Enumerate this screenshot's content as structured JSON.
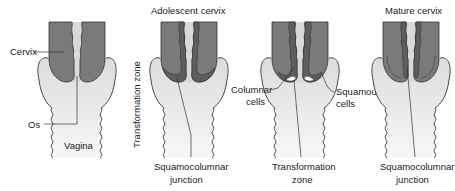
{
  "figure": {
    "colors": {
      "cervix_dark": "#7a7a7a",
      "columnar_band": "#5e5e5e",
      "vagina_light": "#e4e4e4",
      "canal": "#d9d9d9",
      "outline": "#333333",
      "background": "#ffffff"
    },
    "panels": [
      {
        "id": "panel-1",
        "title": "",
        "labels": {
          "cervix": "Cervix",
          "os": "Os",
          "vagina": "Vagina"
        }
      },
      {
        "id": "panel-2",
        "title": "Adolescent cervix",
        "labels": {
          "side": "Transformation zone",
          "bottom_line1": "Squamocolumnar",
          "bottom_line2": "junction"
        }
      },
      {
        "id": "panel-3",
        "title": "",
        "labels": {
          "left_line1": "Columnar",
          "left_line2": "cells",
          "right_line1": "Squamous",
          "right_line2": "cells",
          "bottom_line1": "Transformation",
          "bottom_line2": "zone"
        }
      },
      {
        "id": "panel-4",
        "title": "Mature cervix",
        "labels": {
          "bottom_line1": "Squamocolumnar",
          "bottom_line2": "junction"
        }
      }
    ]
  }
}
